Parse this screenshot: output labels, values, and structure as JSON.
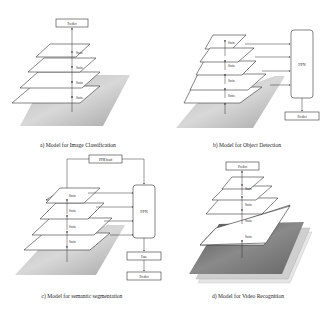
{
  "figure": {
    "panels": [
      {
        "id": "a",
        "caption": "a) Model for Image Classification",
        "head_box": "Predict",
        "stages": [
          "Swin",
          "Swin",
          "Swin",
          "Swin"
        ],
        "input": "image"
      },
      {
        "id": "b",
        "caption": "b) Model for Object Detection",
        "neck_box": "FPN",
        "output_box": "Predict",
        "stages": [
          "Swin",
          "Swin",
          "Swin",
          "Swin"
        ],
        "input": "image"
      },
      {
        "id": "c",
        "caption": "c) Model for semantic segmentation",
        "top_box": "PPM head",
        "neck_box": "FPN",
        "fuse_box": "Fuse",
        "output_box": "Predict",
        "stages": [
          "Swin",
          "Swin",
          "Swin",
          "Swin"
        ],
        "input": "image"
      },
      {
        "id": "d",
        "caption": "d) Model for Video Recognition",
        "head_box": "Predict",
        "stages": [
          "Swin",
          "Swin",
          "Swin",
          "Swin"
        ],
        "input": "video frames"
      }
    ]
  }
}
